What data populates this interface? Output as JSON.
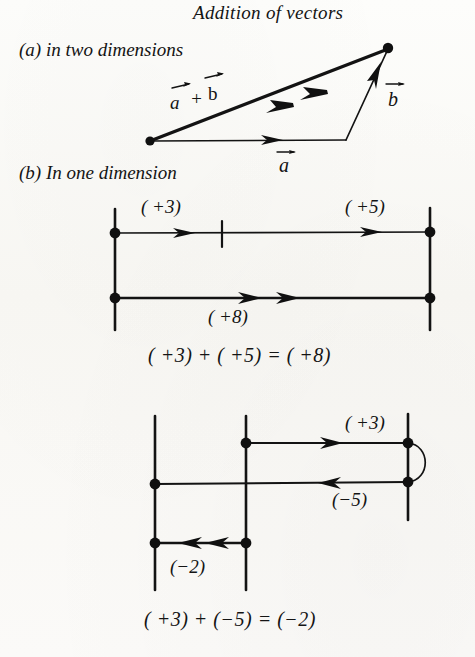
{
  "figure": {
    "title": "Addition of vectors",
    "type": "diagram",
    "topic": "vector addition",
    "sections": [
      {
        "key": "a",
        "label": "(a) in two dimensions",
        "description": "triangle showing vector a plus vector b equals resultant a+b",
        "vector_labels": {
          "resultant": "a + b",
          "first": "a",
          "second": "b"
        }
      },
      {
        "key": "b",
        "label": "(b) In one dimension",
        "description": "number-line style addition of signed displacements",
        "cases": [
          {
            "name": "same-direction",
            "top_left_label": "(+3)",
            "top_right_label": "(+5)",
            "bottom_label": "(+8)",
            "equation": "( + 3) + ( + 5) = ( + 8)"
          },
          {
            "name": "opposite-direction",
            "first_label": "(+3)",
            "second_label": "(−5)",
            "result_label": "(−2)",
            "equation": "( + 3) + ( − 5) = ( − 2)"
          }
        ]
      }
    ]
  },
  "labels": {
    "title": "Addition of vectors",
    "part_a": "(a) in two dimensions",
    "part_b": "(b) In one dimension",
    "vec_sum": "a + b",
    "vec_a": "a",
    "vec_b": "b",
    "plus3_top": "( +3)",
    "plus5_top": "( +5)",
    "plus8": "( +8)",
    "plus3_bottom": "( +3)",
    "minus5": "(−5)",
    "minus2": "(−2)",
    "equation_1": "( +3) + ( +5) = ( +8)",
    "equation_2": "( +3) + (−5) = (−2)"
  },
  "colors": {
    "ink": "#131313",
    "paper": "#fbfaf7"
  }
}
